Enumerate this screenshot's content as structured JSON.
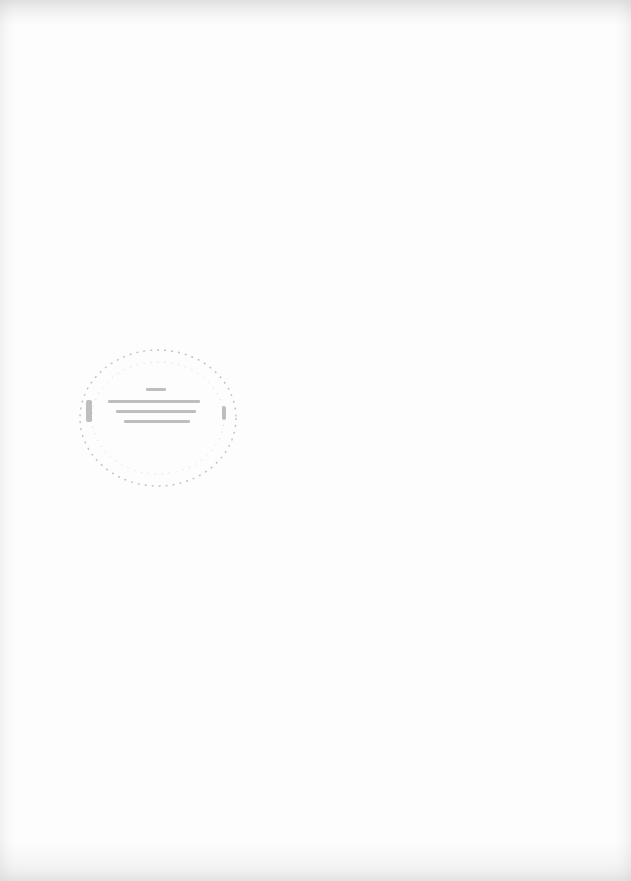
{
  "page": {
    "type": "scanned-blank-page",
    "background_color": "#fdfdfd"
  },
  "stamp": {
    "shape": "circle",
    "text": "",
    "legible": false,
    "ink_color": "#9a9a9a"
  }
}
